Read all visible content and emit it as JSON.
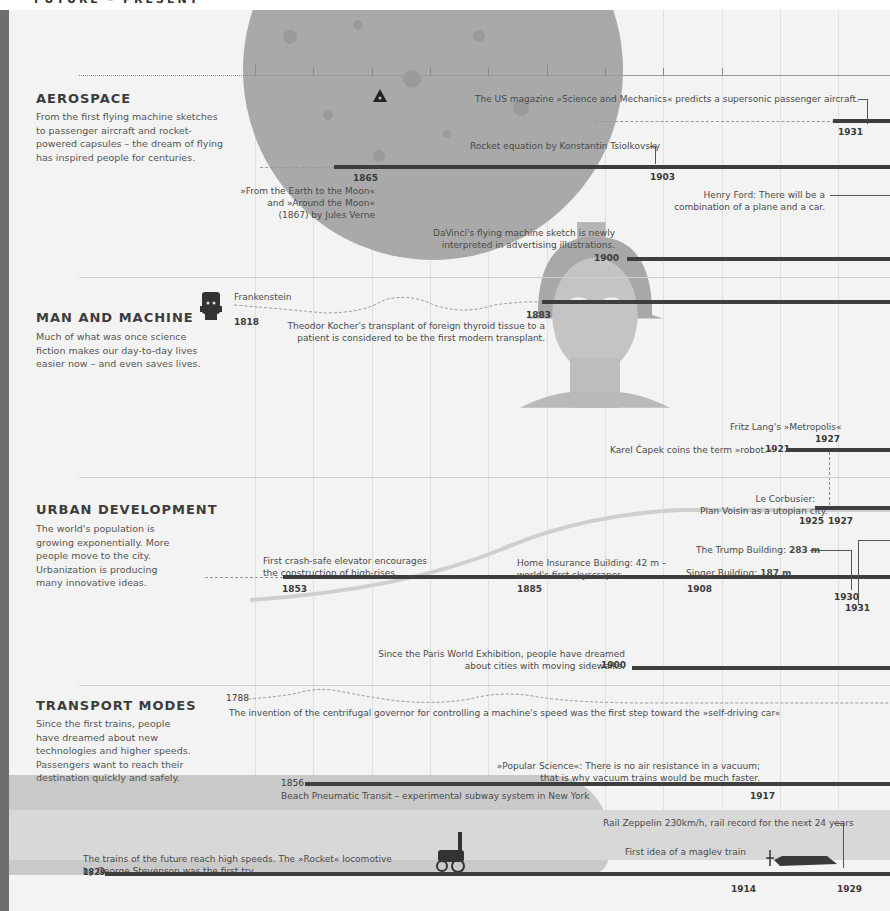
{
  "header": {
    "title": "FUTURE – PRESENT"
  },
  "axis": {
    "ticks": [
      {
        "label": "1850"
      },
      {
        "label": "1900"
      }
    ]
  },
  "sections": [
    {
      "title": "AEROSPACE",
      "description": "From the first flying machine sketches to passenger aircraft and rocket-powered capsules – the dream of flying has inspired people for centuries.",
      "events": [
        {
          "label": "The US magazine »Science and Mechanics« predicts a supersonic passenger aircraft.",
          "year": "1931"
        },
        {
          "label": "Rocket equation by Konstantin Tsiolkovsky",
          "year": "1903"
        },
        {
          "label_lines": [
            "»From the Earth to the Moon«",
            "and »Around the Moon«",
            "(1867) by Jules Verne"
          ],
          "year": "1865"
        },
        {
          "label_lines": [
            "Henry Ford: There will be a",
            "combination of a plane and a car."
          ]
        },
        {
          "label_lines": [
            "DaVinci's flying machine sketch is newly",
            "interpreted in advertising illustrations."
          ],
          "year": "1900"
        }
      ]
    },
    {
      "title": "MAN AND MACHINE",
      "description": "Much of what was once science fiction makes our day-to-day lives easier now – and even saves lives.",
      "events": [
        {
          "label": "Frankenstein",
          "year": "1818"
        },
        {
          "label_lines": [
            "Theodor Kocher's transplant of foreign thyroid tissue to a",
            "patient is considered to be the first modern transplant."
          ],
          "year": "1883"
        },
        {
          "label": "Fritz Lang's »Metropolis«",
          "year": "1927"
        },
        {
          "label": "Karel Čapek coins the term »robot.«",
          "year": "1921"
        }
      ]
    },
    {
      "title": "URBAN DEVELOPMENT",
      "description": "The world's population is growing exponentially. More people move to the city. Urbanization is producing many innovative ideas.",
      "events": [
        {
          "label_lines": [
            "Le Corbusier:",
            "Plan Voisin as a utopian city."
          ],
          "year": "1925",
          "year2": "1927"
        },
        {
          "label_lines": [
            "First crash-safe elevator encourages",
            "the construction of high-rises."
          ],
          "year": "1853"
        },
        {
          "label_lines": [
            "Home Insurance Building: 42 m –",
            "world's first skyscraper"
          ],
          "year": "1885"
        },
        {
          "label": "Singer Building:",
          "value": "187 m",
          "year": "1908"
        },
        {
          "label": "The Trump Building:",
          "value": "283 m",
          "year": "1930"
        },
        {
          "year": "1931"
        },
        {
          "label_lines": [
            "Since the Paris World Exhibition, people have dreamed",
            "about cities with moving sidewalks."
          ],
          "year": "1900"
        }
      ]
    },
    {
      "title": "TRANSPORT MODES",
      "description": "Since the first trains, people have dreamed about new technologies and higher speeds. Passengers want to reach their destination quickly and safely.",
      "events": [
        {
          "label": "The invention of the centrifugal governor for controlling a machine's speed was the first step toward the »self-driving car«",
          "year": "1788"
        },
        {
          "label_lines": [
            "»Popular Science«: There is no air resistance in a vacuum;",
            "that is why vacuum trains would be much faster."
          ],
          "year": "1917"
        },
        {
          "label": "Beach Pneumatic Transit – experimental subway system in New York",
          "year": "1856"
        },
        {
          "label": "Rail Zeppelin 230km/h, rail record for the next 24 years",
          "year": "1929"
        },
        {
          "label": "First idea of a maglev train",
          "year": "1914"
        },
        {
          "label_lines": [
            "The trains of the future reach high speeds. The »Rocket« locomotive",
            "by George Stevenson was the first try."
          ],
          "year": "1829"
        }
      ]
    }
  ],
  "icons": [
    "moon-illustration",
    "rocket-capsule-icon",
    "frankenstein-head-icon",
    "robot-maria-illustration",
    "rocket-locomotive-icon",
    "maglev-train-icon",
    "high-speed-train-illustration"
  ]
}
